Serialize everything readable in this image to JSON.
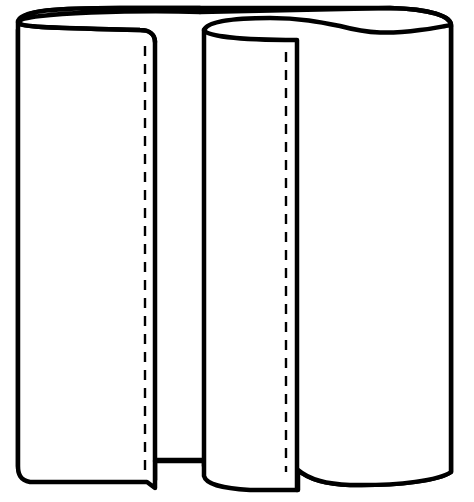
{
  "figure": {
    "title": "Two rolled sheets with seam lines",
    "colors": {
      "stroke": "#000000",
      "fill": "#ffffff"
    },
    "parts": [
      {
        "id": "back-sheet",
        "label": "back sheet (shared backing)"
      },
      {
        "id": "left-roll",
        "label": "left rolled panel",
        "seam": "dashed stitch line"
      },
      {
        "id": "right-roll",
        "label": "right rolled panel",
        "seam": "dashed stitch line"
      }
    ]
  }
}
